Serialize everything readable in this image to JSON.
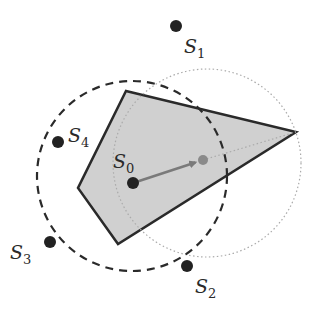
{
  "diagram": {
    "colors": {
      "polygon_fill": "#d0d0d0",
      "polygon_stroke": "#2a2a2a",
      "point": "#222222",
      "moved_point": "#8a8a8a",
      "arrow": "#7a7a7a",
      "dashed_circle": "#2a2a2a",
      "dotted_circle": "#aaaaaa"
    },
    "polygon": [
      [
        126,
        91
      ],
      [
        296,
        132
      ],
      [
        118,
        244
      ],
      [
        78,
        188
      ]
    ],
    "dashed_circle": {
      "cx": 132,
      "cy": 176,
      "r": 95
    },
    "dotted_circle": {
      "cx": 207,
      "cy": 163,
      "r": 94
    },
    "arrow": {
      "from": [
        133,
        183
      ],
      "to": [
        203,
        160
      ]
    },
    "dotted_line": {
      "from": [
        203,
        160
      ],
      "to": [
        296,
        132
      ]
    },
    "points": [
      {
        "id": "S0",
        "letter": "S",
        "sub": "0",
        "x": 133,
        "y": 183,
        "label_x": 113,
        "label_y": 168
      },
      {
        "id": "S1",
        "letter": "S",
        "sub": "1",
        "x": 176,
        "y": 26,
        "label_x": 184,
        "label_y": 53
      },
      {
        "id": "S2",
        "letter": "S",
        "sub": "2",
        "x": 187,
        "y": 266,
        "label_x": 195,
        "label_y": 293
      },
      {
        "id": "S3",
        "letter": "S",
        "sub": "3",
        "x": 50,
        "y": 242,
        "label_x": 10,
        "label_y": 259
      },
      {
        "id": "S4",
        "letter": "S",
        "sub": "4",
        "x": 58,
        "y": 142,
        "label_x": 68,
        "label_y": 142
      }
    ],
    "moved_point": {
      "x": 203,
      "y": 160
    }
  }
}
